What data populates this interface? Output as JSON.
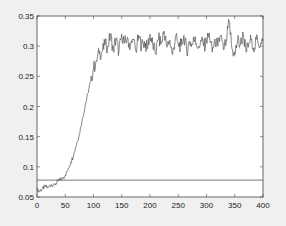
{
  "chart_data": {
    "type": "line",
    "title": "",
    "xlabel": "",
    "ylabel": "",
    "xlim": [
      0,
      400
    ],
    "ylim": [
      0.05,
      0.35
    ],
    "xticks": [
      0,
      50,
      100,
      150,
      200,
      250,
      300,
      350,
      400
    ],
    "yticks": [
      0.05,
      0.1,
      0.15,
      0.2,
      0.25,
      0.3,
      0.35
    ],
    "ytick_labels": [
      "0.05",
      "0.1",
      "0.15",
      "0.2",
      "0.25",
      "0.3",
      "0.35"
    ],
    "grid": false,
    "legend": null,
    "series": [
      {
        "name": "signal",
        "color": "#555555",
        "description": "Noisy sigmoid rise from ~0.06 at x=0 to a plateau of ~0.305 reached near x=120; noise amplitude about ±0.02 on plateau",
        "x": [
          0,
          5,
          10,
          15,
          20,
          25,
          30,
          35,
          40,
          45,
          50,
          55,
          60,
          65,
          70,
          75,
          80,
          85,
          90,
          95,
          100,
          105,
          110,
          115,
          120,
          125,
          130,
          135,
          140,
          145,
          150,
          155,
          160,
          165,
          170,
          175,
          180,
          185,
          190,
          195,
          200,
          205,
          210,
          215,
          220,
          225,
          230,
          235,
          240,
          245,
          250,
          255,
          260,
          265,
          270,
          275,
          280,
          285,
          290,
          295,
          300,
          305,
          310,
          315,
          320,
          325,
          330,
          335,
          340,
          345,
          350,
          355,
          360,
          365,
          370,
          375,
          380,
          385,
          390,
          395,
          400
        ],
        "values": [
          0.062,
          0.06,
          0.065,
          0.067,
          0.066,
          0.071,
          0.07,
          0.074,
          0.078,
          0.081,
          0.086,
          0.096,
          0.108,
          0.12,
          0.138,
          0.155,
          0.178,
          0.2,
          0.222,
          0.243,
          0.262,
          0.276,
          0.288,
          0.29,
          0.302,
          0.3,
          0.318,
          0.295,
          0.312,
          0.29,
          0.32,
          0.305,
          0.315,
          0.298,
          0.31,
          0.292,
          0.318,
          0.3,
          0.308,
          0.296,
          0.32,
          0.302,
          0.288,
          0.312,
          0.305,
          0.325,
          0.298,
          0.31,
          0.286,
          0.315,
          0.304,
          0.3,
          0.318,
          0.292,
          0.308,
          0.302,
          0.316,
          0.296,
          0.31,
          0.3,
          0.306,
          0.322,
          0.29,
          0.312,
          0.3,
          0.318,
          0.294,
          0.308,
          0.342,
          0.296,
          0.285,
          0.31,
          0.302,
          0.32,
          0.29,
          0.306,
          0.312,
          0.296,
          0.315,
          0.3,
          0.308
        ]
      },
      {
        "name": "threshold",
        "color": "#555555",
        "description": "Horizontal reference line",
        "x": [
          0,
          400
        ],
        "values": [
          0.078,
          0.078
        ]
      }
    ]
  },
  "colors": {
    "figure_bg": "#f0f0f0",
    "axes_bg": "#ffffff",
    "axis": "#444444",
    "line": "#555555"
  }
}
